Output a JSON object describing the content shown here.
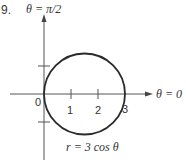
{
  "problem_number": "9.",
  "axis_labels": {
    "vertical": "θ = π/2",
    "horizontal": "θ = 0"
  },
  "tick_labels": [
    "0",
    "1",
    "2",
    "3"
  ],
  "curve_label": "r = 3 cos θ",
  "colors": {
    "curve": "#2a2a2a",
    "axis": "#555555"
  }
}
